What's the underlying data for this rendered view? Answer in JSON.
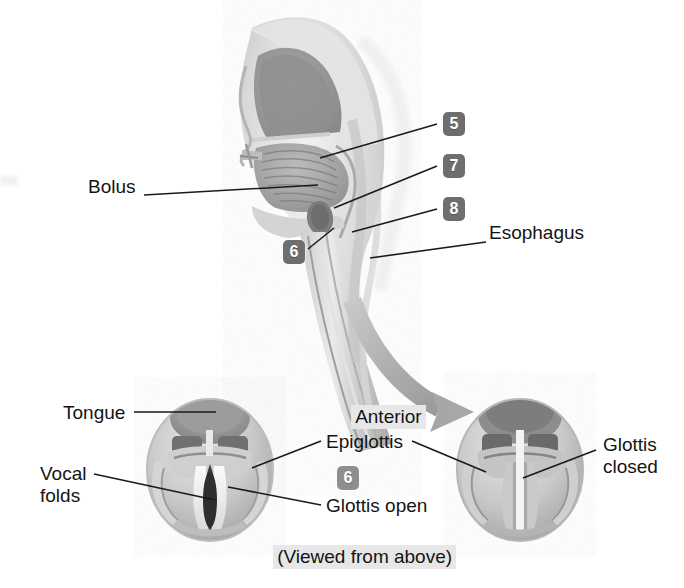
{
  "figure": {
    "background_color": "#ffffff",
    "line_color": "#1a1a1a",
    "chip_color": "#6e6e6e",
    "chip_light_color": "#8e8e8e",
    "highlight_color": "#e7e7e7"
  },
  "upper_panel": {
    "name": "sagittal-section-of-head-and-neck",
    "labels": [
      {
        "id": "bolus",
        "text": "Bolus",
        "x": 88,
        "y": 186
      },
      {
        "id": "esophagus",
        "text": "Esophagus",
        "x": 489,
        "y": 232
      }
    ],
    "callouts": [
      {
        "id": "callout-5",
        "number": "5",
        "x": 443,
        "y": 112,
        "tone": "dark"
      },
      {
        "id": "callout-7",
        "number": "7",
        "x": 443,
        "y": 154,
        "tone": "dark"
      },
      {
        "id": "callout-8",
        "number": "8",
        "x": 443,
        "y": 197,
        "tone": "dark"
      },
      {
        "id": "callout-6-sagittal",
        "number": "6",
        "x": 283,
        "y": 240,
        "tone": "dark"
      }
    ]
  },
  "lower_panel": {
    "name": "laryngeal-views-from-above",
    "orientation_label": {
      "id": "anterior",
      "text": "Anterior",
      "x": 330,
      "y": 392
    },
    "caption": {
      "id": "viewed-from-above",
      "text": "(Viewed from above)",
      "x": 252,
      "y": 530
    },
    "callouts": [
      {
        "id": "callout-6-larynx",
        "number": "6",
        "x": 337,
        "y": 466,
        "tone": "light"
      }
    ],
    "left_view": {
      "id": "glottis-open-view",
      "labels": [
        {
          "id": "tongue",
          "text": "Tongue",
          "x": 63,
          "y": 404
        },
        {
          "id": "vocal-folds-line1",
          "text": "Vocal",
          "x": 40,
          "y": 473
        },
        {
          "id": "vocal-folds-line2",
          "text": "folds",
          "x": 40,
          "y": 494
        }
      ]
    },
    "center_labels": [
      {
        "id": "epiglottis",
        "text": "Epiglottis",
        "x": 325,
        "y": 434
      },
      {
        "id": "glottis-open",
        "text": "Glottis open",
        "x": 325,
        "y": 498
      }
    ],
    "right_view": {
      "id": "glottis-closed-view",
      "labels": [
        {
          "id": "glottis-closed-line1",
          "text": "Glottis",
          "x": 603,
          "y": 443
        },
        {
          "id": "glottis-closed-line2",
          "text": "closed",
          "x": 603,
          "y": 465
        }
      ]
    }
  }
}
